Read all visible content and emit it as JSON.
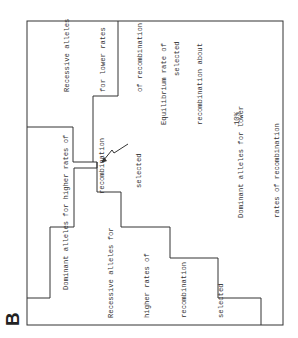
{
  "panel_label": "B",
  "regions": [
    {
      "id": "recessive-lower",
      "lines": [
        "Recessive alleles",
        "for lower rates",
        "of recombination",
        "selected"
      ]
    },
    {
      "id": "equilibrium",
      "lines": [
        "Equilibrium rate of",
        "recombination about",
        "10%"
      ]
    },
    {
      "id": "dominant-lower",
      "lines": [
        "Dominant alleles for lower",
        "rates of recombination",
        "selected"
      ]
    },
    {
      "id": "dominant-higher",
      "lines": [
        "Dominant alleles for higher rates of",
        "recombination",
        "selected"
      ]
    },
    {
      "id": "recessive-higher",
      "lines": [
        "Recessive alleles for",
        "higher rates of",
        "recombination",
        "selected"
      ]
    }
  ],
  "colors": {
    "line": "#333333",
    "text": "#333333",
    "background": "#ffffff"
  }
}
